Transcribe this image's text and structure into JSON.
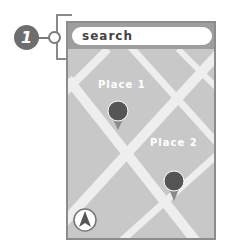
{
  "callout": {
    "number": "1",
    "icon": "numbered-callout-badge"
  },
  "search": {
    "placeholder": "search"
  },
  "places": [
    {
      "label": "Place 1",
      "icon": "map-pin-icon"
    },
    {
      "label": "Place 2",
      "icon": "map-pin-icon"
    }
  ],
  "compass": {
    "icon": "north-arrow-icon"
  },
  "colors": {
    "map_background": "#c8c8c8",
    "road": "#eeeeee",
    "pin": "#555555",
    "pin_tail": "#8a8a8a",
    "frame": "#8c8c8c",
    "callout": "#6e6e6e"
  }
}
